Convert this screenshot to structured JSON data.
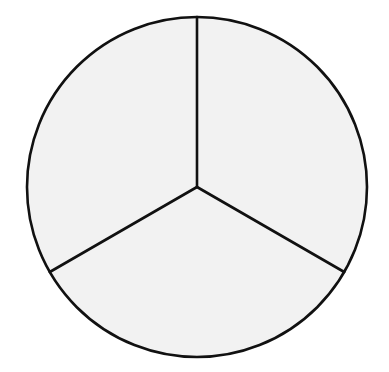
{
  "diagram": {
    "shape": "circle",
    "parts": 3,
    "slices": [
      {
        "name": "right-third",
        "fraction": 0.3333,
        "start_angle_deg": 0,
        "end_angle_deg": 120
      },
      {
        "name": "bottom-third",
        "fraction": 0.3333,
        "start_angle_deg": 120,
        "end_angle_deg": 240
      },
      {
        "name": "left-third",
        "fraction": 0.3333,
        "start_angle_deg": 240,
        "end_angle_deg": 360
      }
    ],
    "colors": {
      "fill": "#f2f2f2",
      "stroke": "#111111",
      "background": "#ffffff"
    }
  }
}
